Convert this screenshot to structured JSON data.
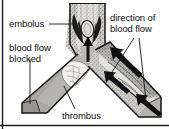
{
  "figure": {
    "background_color": "#ffffff",
    "border_color": "#1a1a1a",
    "width": 169,
    "height": 129
  },
  "labels": {
    "embolus": "embolus",
    "blood_flow_blocked": "blood flow\nblocked",
    "direction_of_blood_flow": "direction of\nblood flow",
    "thrombus": "thrombus"
  },
  "structures": {
    "main_vessel": "vertical blood vessel trunk at top center",
    "left_branch": "left branch vessel, blocked, shown in flat grey shading",
    "right_branch": "right branch vessel with open lumen and flowing blood",
    "embolus_body": "pale oval embolus lodged at the vessel bifurcation",
    "thrombus_body": "pale clot adhering to the wall of the left branch"
  },
  "arrows": {
    "up_main": "upward arrow in main trunk showing blood flow",
    "up_right_upper": "upward-left arrow in right branch",
    "up_right_lower": "upward-left arrow near right branch opening",
    "inflow_right": "arrow entering from lower right end of right branch"
  },
  "colors": {
    "vessel_wall": "#1a1a1a",
    "vessel_fill_light": "#f2f1ee",
    "vessel_fill_mid": "#b9b7b3",
    "vessel_fill_dark": "#8d8b88",
    "blocked_fill": "#a8a6a2",
    "embolus_fill": "#ececea",
    "thrombus_fill": "#efeeec",
    "label_text": "#111111",
    "leader_line": "#1a1a1a"
  }
}
